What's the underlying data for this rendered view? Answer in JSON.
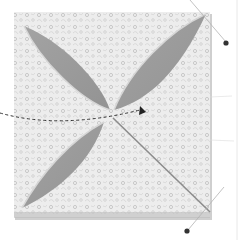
{
  "image": {
    "subject": "folded fabric quilt square with four petal cut-outs, pins and a dashed arrow",
    "colors": {
      "background": "#ffffff",
      "fabric_light": "#ececec",
      "fabric_pattern": "#b8b8b8",
      "petal_gray": "#9a9a9a",
      "edge_shadow": "#8a8a8a",
      "pin_head": "#333333",
      "pin_shaft": "#b0b0b0",
      "arrow": "#333333"
    },
    "elements": {
      "square": "fabric square",
      "petals": [
        "top-left petal",
        "top-right petal",
        "bottom-left petal"
      ],
      "fold_line": "diagonal fold to bottom-right",
      "pins": [
        "top-right pin",
        "bottom-right pin"
      ],
      "arrow": "dashed curved arrow pointing right"
    }
  }
}
